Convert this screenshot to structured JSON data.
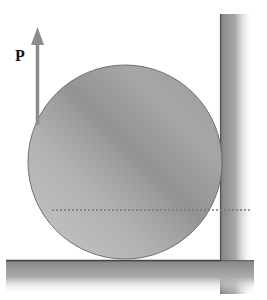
{
  "diagram": {
    "title": "",
    "force": {
      "label": "P",
      "direction": "up",
      "color": "#8c8c8c"
    },
    "sphere": {
      "center": [
        125,
        162
      ],
      "radius": 97,
      "fill_light": "#c4c4c4",
      "fill_dark": "#8e8e8e",
      "outline": "#707070"
    },
    "wall": {
      "side": "right",
      "color": "#9a9a9a"
    },
    "floor": {
      "color": "#9a9a9a"
    },
    "center_line": {
      "style": "dotted",
      "y": 210
    }
  }
}
